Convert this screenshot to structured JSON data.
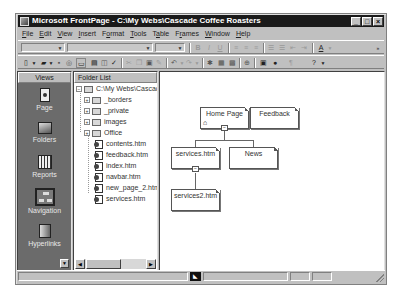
{
  "window": {
    "title": "Microsoft FrontPage - C:\\My Webs\\Cascade Coffee Roasters",
    "controls": [
      "_",
      "□",
      "×"
    ]
  },
  "menu": [
    {
      "label": "File",
      "accel": "F"
    },
    {
      "label": "Edit",
      "accel": "E"
    },
    {
      "label": "View",
      "accel": "V"
    },
    {
      "label": "Insert",
      "accel": "I"
    },
    {
      "label": "Format",
      "accel": "o"
    },
    {
      "label": "Tools",
      "accel": "T"
    },
    {
      "label": "Table",
      "accel": "a"
    },
    {
      "label": "Frames",
      "accel": "r"
    },
    {
      "label": "Window",
      "accel": "W"
    },
    {
      "label": "Help",
      "accel": "H"
    }
  ],
  "toolbar_formatting": {
    "style_combo": "",
    "font_combo": "",
    "size_combo": "",
    "bold": "B",
    "italic": "I",
    "underline": "U",
    "font_color": "A"
  },
  "toolbar_standard": {
    "icons": [
      "new-page",
      "open",
      "save",
      "publish",
      "folder-list",
      "print",
      "preview",
      "spelling",
      "cut",
      "copy",
      "paste",
      "format-painter",
      "undo",
      "redo",
      "insert-component",
      "insert-table",
      "insert-image",
      "hyperlink",
      "refresh",
      "stop",
      "show-all",
      "help"
    ]
  },
  "views": {
    "header": "Views",
    "items": [
      {
        "label": "Page",
        "icon": "page-icon",
        "active": false
      },
      {
        "label": "Folders",
        "icon": "folders-icon",
        "active": false
      },
      {
        "label": "Reports",
        "icon": "reports-icon",
        "active": false
      },
      {
        "label": "Navigation",
        "icon": "navigation-icon",
        "active": true
      },
      {
        "label": "Hyperlinks",
        "icon": "hyperlinks-icon",
        "active": false
      }
    ]
  },
  "folder_list": {
    "header": "Folder List",
    "root": "C:\\My Webs\\Cascac",
    "folders": [
      "_borders",
      "_private",
      "images",
      "Office"
    ],
    "files": [
      "contents.htm",
      "feedback.htm",
      "index.htm",
      "navbar.htm",
      "new_page_2.htm",
      "services.htm"
    ]
  },
  "navigation": {
    "pages": [
      {
        "id": "home",
        "label": "Home Page",
        "is_home": true
      },
      {
        "id": "feedback",
        "label": "Feedback"
      },
      {
        "id": "services",
        "label": "services.htm"
      },
      {
        "id": "news",
        "label": "News"
      },
      {
        "id": "services2",
        "label": "services2.htm"
      }
    ],
    "collapse_symbol": "−"
  },
  "status_bar": {
    "text": ""
  }
}
